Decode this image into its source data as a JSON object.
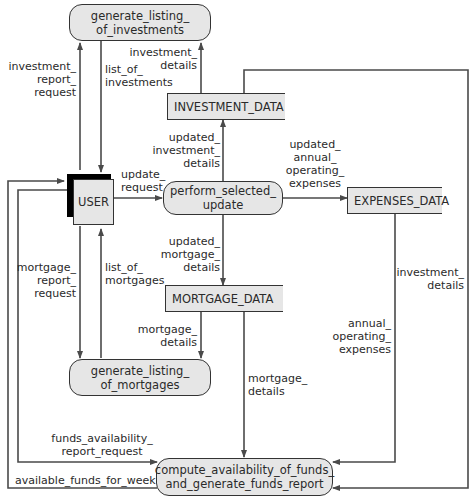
{
  "processes": {
    "generate_investments": "generate_listing_\nof_investments",
    "perform_update": "perform_selected_\nupdate",
    "generate_mortgages": "generate_listing_\nof_mortgages",
    "compute_funds": "compute_availability_of_funds_\nand_generate_funds_report"
  },
  "entities": {
    "user": "USER"
  },
  "data_stores": {
    "investment_data": "INVESTMENT_DATA",
    "expenses_data": "EXPENSES_DATA",
    "mortgage_data": "MORTGAGE_DATA"
  },
  "flows": {
    "investment_report_request": "investment_\nreport_\nrequest",
    "list_of_investments": "list_of_\ninvestments",
    "investment_details_top": "investment_\ndetails",
    "updated_investment_details": "updated_\ninvestment_\ndetails",
    "update_request": "update_\nrequest",
    "updated_annual_operating_expenses": "updated_\nannual_\noperating_\nexpenses",
    "updated_mortgage_details": "updated_\nmortgage_\ndetails",
    "mortgage_report_request": "mortgage_\nreport_\nrequest",
    "list_of_mortgages": "list_of_\nmortgages",
    "mortgage_details_left": "mortgage_\ndetails",
    "mortgage_details_bottom": "mortgage_\ndetails",
    "annual_operating_expenses": "annual_\noperating_\nexpenses",
    "investment_details_right": "investment_\ndetails",
    "funds_availability_report_request": "funds_availability_\nreport_request",
    "available_funds_for_week": "available_funds_for_week"
  },
  "colors": {
    "line": "#4a4a4a",
    "fill": "#e6e6e6",
    "border": "#333333"
  }
}
